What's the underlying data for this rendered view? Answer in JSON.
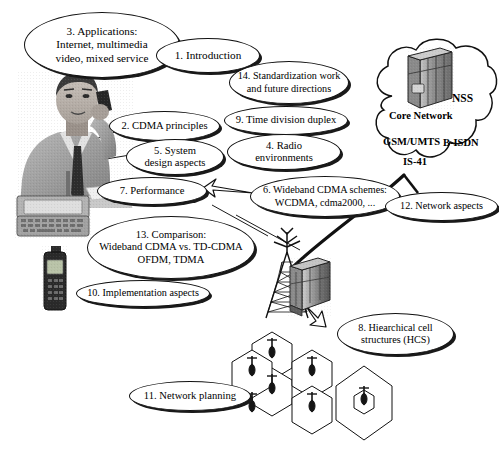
{
  "figure": {
    "title": "WCDMA / wideband CDMA book chapter overview diagram",
    "background": "#ffffff",
    "line_color": "#111111",
    "width": 499,
    "height": 454
  },
  "topics": [
    {
      "id": "topic-3",
      "name": "topic-applications",
      "lines": [
        "3. Applications:",
        "Internet, multimedia",
        "video, mixed service"
      ],
      "x": 24,
      "y": 12,
      "w": 156,
      "h": 66,
      "font_size": 11.2
    },
    {
      "id": "topic-1",
      "name": "topic-introduction",
      "lines": [
        "1. Introduction"
      ],
      "x": 156,
      "y": 38,
      "w": 104,
      "h": 35,
      "font_size": 11.2
    },
    {
      "id": "topic-14",
      "name": "topic-standardization",
      "lines": [
        "14. Standardization work",
        "and future directions"
      ],
      "x": 229,
      "y": 61,
      "w": 120,
      "h": 43,
      "font_size": 10.2
    },
    {
      "id": "topic-2",
      "name": "topic-cdma-principles",
      "lines": [
        "2. CDMA principles"
      ],
      "x": 109,
      "y": 111,
      "w": 111,
      "h": 30,
      "font_size": 10.6
    },
    {
      "id": "topic-9",
      "name": "topic-time-division-duplex",
      "lines": [
        "9. Time division duplex"
      ],
      "x": 224,
      "y": 106,
      "w": 124,
      "h": 29,
      "font_size": 10.6
    },
    {
      "id": "topic-5",
      "name": "topic-system-design-aspects",
      "lines": [
        "5. System",
        "design aspects"
      ],
      "x": 126,
      "y": 139,
      "w": 98,
      "h": 36,
      "font_size": 10.6
    },
    {
      "id": "topic-4",
      "name": "topic-radio-environments",
      "lines": [
        "4. Radio",
        "environments"
      ],
      "x": 227,
      "y": 134,
      "w": 114,
      "h": 36,
      "font_size": 10.6
    },
    {
      "id": "topic-7",
      "name": "topic-performance",
      "lines": [
        "7. Performance"
      ],
      "x": 97,
      "y": 177,
      "w": 110,
      "h": 28,
      "font_size": 10.6
    },
    {
      "id": "topic-6",
      "name": "topic-wideband-cdma-schemes",
      "lines": [
        "6. Wideband CDMA schemes:",
        "WCDMA, cdma2000, ..."
      ],
      "x": 250,
      "y": 176,
      "w": 150,
      "h": 41,
      "font_size": 10.2
    },
    {
      "id": "topic-12",
      "name": "topic-network-aspects",
      "lines": [
        "12. Network aspects"
      ],
      "x": 385,
      "y": 192,
      "w": 113,
      "h": 29,
      "font_size": 10.2
    },
    {
      "id": "topic-13",
      "name": "topic-comparison",
      "lines": [
        "13.  Comparison:",
        "Wideband CDMA vs. TD-CDMA",
        "OFDM, TDMA"
      ],
      "x": 87,
      "y": 216,
      "w": 168,
      "h": 63,
      "font_size": 10.6
    },
    {
      "id": "topic-10",
      "name": "topic-implementation-aspects",
      "lines": [
        "10. Implementation aspects"
      ],
      "x": 76,
      "y": 280,
      "w": 134,
      "h": 27,
      "font_size": 10.2
    },
    {
      "id": "topic-8",
      "name": "topic-hierarchical-cell-structures",
      "lines": [
        "8. Hiearchical cell",
        "structures (HCS)"
      ],
      "x": 337,
      "y": 313,
      "w": 117,
      "h": 42,
      "font_size": 10.2
    },
    {
      "id": "topic-11",
      "name": "topic-network-planning",
      "lines": [
        "11. Network planning"
      ],
      "x": 129,
      "y": 381,
      "w": 122,
      "h": 30,
      "font_size": 10.6
    }
  ],
  "cloud": {
    "name": "core-network-cloud",
    "labels": [
      {
        "name": "cloud-label-nss",
        "text": "NSS",
        "x": 456,
        "y": 99,
        "size": 11.5
      },
      {
        "name": "cloud-label-core-network",
        "text": "Core Network",
        "x": 395,
        "y": 117,
        "size": 10.5
      },
      {
        "name": "cloud-label-gsm-umts",
        "text": "GSM/UMTS",
        "x": 389,
        "y": 143,
        "size": 10.5
      },
      {
        "name": "cloud-label-b-isdn",
        "text": "B-ISDN",
        "x": 449,
        "y": 142,
        "size": 10.5
      },
      {
        "name": "cloud-label-is-41",
        "text": "IS-41",
        "x": 409,
        "y": 162,
        "size": 10.5
      }
    ]
  },
  "graphics": {
    "man_on_phone": "photo of a businessman talking on a mobile phone",
    "pda": "photo of a PDA / communicator with keyboard and antenna",
    "handset": "photo of a mobile phone handset",
    "base_station_tower": "lattice radio mast with antennas",
    "equipment_cabinet": "base station equipment cabinet",
    "cells": "hierarchical hexagonal cell structure with base station antennas",
    "server_rack": "network switching subsystem equipment rack inside the cloud"
  },
  "connectors": [
    "man-to-cdma-principles",
    "man-to-system-design",
    "man-to-performance",
    "performance-to-wideband-cdma-arrow",
    "comparison-to-tower",
    "tower-to-core-network-cloud",
    "cabinet-to-cells-arrow"
  ]
}
